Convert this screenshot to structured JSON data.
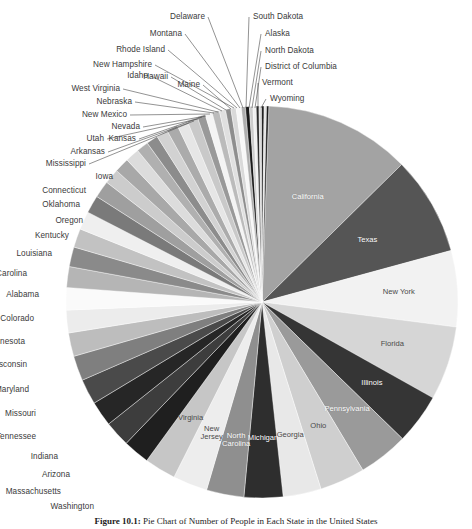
{
  "figure": {
    "center_x": 262,
    "center_y": 302,
    "radius": 196,
    "start_angle_deg": -88,
    "caption_prefix": "Figure 10.1: ",
    "caption_text": "Pie Chart of Number of People in Each State in the United States"
  },
  "chart_data": {
    "type": "pie",
    "title": "Pie Chart of Number of People in Each State in the United States",
    "xlabel": "",
    "ylabel": "",
    "legend_position": "none",
    "grid": false,
    "total": 309138711,
    "categories": [
      "California",
      "Texas",
      "New York",
      "Florida",
      "Illinois",
      "Pennsylvania",
      "Ohio",
      "Georgia",
      "Michigan",
      "North Carolina",
      "New Jersey",
      "Virginia",
      "Washington",
      "Massachusetts",
      "Arizona",
      "Indiana",
      "Tennessee",
      "Missouri",
      "Maryland",
      "Wisconsin",
      "Minnesota",
      "Colorado",
      "Alabama",
      "South Carolina",
      "Louisiana",
      "Kentucky",
      "Oregon",
      "Oklahoma",
      "Connecticut",
      "Iowa",
      "Mississippi",
      "Arkansas",
      "Kansas",
      "Utah",
      "Nevada",
      "New Mexico",
      "Nebraska",
      "West Virginia",
      "Idaho",
      "Hawaii",
      "Maine",
      "New Hampshire",
      "Rhode Island",
      "Montana",
      "Delaware",
      "South Dakota",
      "Alaska",
      "North Dakota",
      "District of Columbia",
      "Vermont",
      "Wyoming"
    ],
    "values": [
      37253956,
      25145561,
      19378102,
      18801310,
      12830632,
      12702379,
      11536504,
      9687653,
      9883640,
      9535483,
      8791894,
      8001024,
      6724540,
      6547629,
      6392017,
      6483802,
      6346105,
      5988927,
      5773552,
      5686986,
      5303925,
      5029196,
      4779736,
      4625364,
      4533372,
      4339367,
      3831074,
      3751351,
      3574097,
      3046355,
      2967297,
      2915918,
      2853118,
      2763885,
      2700551,
      2059179,
      1826341,
      1852994,
      1567582,
      1360301,
      1328361,
      1316470,
      1052567,
      989415,
      897934,
      814180,
      710231,
      672591,
      601723,
      625741,
      563626
    ],
    "colors": [
      "#a3a3a3",
      "#555555",
      "#f2f2f2",
      "#d6d6d6",
      "#353535",
      "#9a9a9a",
      "#cfcfcf",
      "#e8e8e8",
      "#2e2e2e",
      "#8f8f8f",
      "#ededed",
      "#c6c6c6",
      "#1f1f1f",
      "#3d3d3d",
      "#262626",
      "#4a4a4a",
      "#7f7f7f",
      "#bdbdbd",
      "#ececec",
      "#fafafa",
      "#b5b5b5",
      "#8a8a8a",
      "#c2c2c2",
      "#efefef",
      "#7a7a7a",
      "#9f9f9f",
      "#cccccc",
      "#a8a8a8",
      "#dcdcdc",
      "#b0b0b0",
      "#8c8c8c",
      "#d2d2d2",
      "#ababab",
      "#e6e6e6",
      "#c9c9c9",
      "#999999",
      "#f4f4f4",
      "#bbbbbb",
      "#e0e0e0",
      "#8e8e8e",
      "#d9d9d9",
      "#f7f7f7",
      "#aeaeae",
      "#1a1a1a",
      "#cdcdcd",
      "#f0f0f0",
      "#2a2a2a",
      "#dbdbdb",
      "#0f0f0f",
      "#e3e3e3",
      "#1c1c1c"
    ],
    "inside_labels": [
      "California",
      "Texas",
      "New York",
      "Florida",
      "Illinois",
      "Pennsylvania",
      "Ohio",
      "Georgia",
      "Michigan",
      "North Carolina",
      "New Jersey",
      "Virginia"
    ]
  },
  "leader_labels": {
    "right_column": [
      {
        "name": "South Dakota",
        "x": 253,
        "y": 12
      },
      {
        "name": "Alaska",
        "x": 265,
        "y": 29
      },
      {
        "name": "North Dakota",
        "x": 265,
        "y": 46
      },
      {
        "name": "District of Columbia",
        "x": 265,
        "y": 62
      },
      {
        "name": "Vermont",
        "x": 262,
        "y": 78
      },
      {
        "name": "Wyoming",
        "x": 270,
        "y": 94
      }
    ],
    "left_column": [
      {
        "name": "Delaware",
        "x": 205,
        "y": 12
      },
      {
        "name": "Montana",
        "x": 182,
        "y": 29
      },
      {
        "name": "Rhode Island",
        "x": 165,
        "y": 45
      },
      {
        "name": "New Hampshire",
        "x": 152,
        "y": 60
      },
      {
        "name": "Hawaii",
        "x": 168,
        "y": 72
      },
      {
        "name": "Maine",
        "x": 200,
        "y": 80
      },
      {
        "name": "Idaho",
        "x": 148,
        "y": 71
      },
      {
        "name": "West Virginia",
        "x": 120,
        "y": 84
      },
      {
        "name": "Nebraska",
        "x": 132,
        "y": 97
      },
      {
        "name": "New Mexico",
        "x": 127,
        "y": 110
      },
      {
        "name": "Nevada",
        "x": 140,
        "y": 122
      },
      {
        "name": "Kansas",
        "x": 136,
        "y": 134
      },
      {
        "name": "Utah",
        "x": 104,
        "y": 134
      },
      {
        "name": "Arkansas",
        "x": 105,
        "y": 147
      },
      {
        "name": "Mississippi",
        "x": 86,
        "y": 159
      }
    ],
    "side_column": [
      {
        "name": "Iowa",
        "x": 113,
        "y": 172
      },
      {
        "name": "Connecticut",
        "x": 86,
        "y": 186
      },
      {
        "name": "Oklahoma",
        "x": 80,
        "y": 200
      },
      {
        "name": "Oregon",
        "x": 83,
        "y": 216
      },
      {
        "name": "Kentucky",
        "x": 69,
        "y": 231
      },
      {
        "name": "Louisiana",
        "x": 52,
        "y": 249
      },
      {
        "name": "South Carolina",
        "x": 27,
        "y": 269
      },
      {
        "name": "Alabama",
        "x": 39,
        "y": 290
      },
      {
        "name": "Colorado",
        "x": 34,
        "y": 314
      },
      {
        "name": "Minnesota",
        "x": 25,
        "y": 337
      },
      {
        "name": "Wisconsin",
        "x": 27,
        "y": 360
      },
      {
        "name": "Maryland",
        "x": 29,
        "y": 385
      },
      {
        "name": "Missouri",
        "x": 36,
        "y": 409
      },
      {
        "name": "Tennessee",
        "x": 36,
        "y": 432
      },
      {
        "name": "Indiana",
        "x": 58,
        "y": 452
      },
      {
        "name": "Arizona",
        "x": 70,
        "y": 470
      },
      {
        "name": "Massachusetts",
        "x": 61,
        "y": 487
      },
      {
        "name": "Washington",
        "x": 94,
        "y": 502
      }
    ]
  }
}
